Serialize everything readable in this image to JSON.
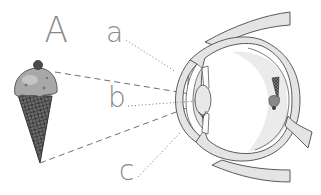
{
  "figure": {
    "label": "A",
    "object": "ice-cream-cone",
    "pointer_labels": [
      {
        "id": "a",
        "text": "a",
        "points_to": "cornea"
      },
      {
        "id": "b",
        "text": "b",
        "points_to": "lens"
      },
      {
        "id": "c",
        "text": "c",
        "points_to": "iris"
      }
    ]
  },
  "colors": {
    "background": "#ffffff",
    "label_text": "#8a8a8a",
    "outline": "#5a5a5a",
    "eye_fill": "#e4e4e4",
    "vitreous_shade": "#ebebeb",
    "dashed_rays": "#707070",
    "ice_cream": "#9a9a9a",
    "cone": "#4a4a4a"
  }
}
